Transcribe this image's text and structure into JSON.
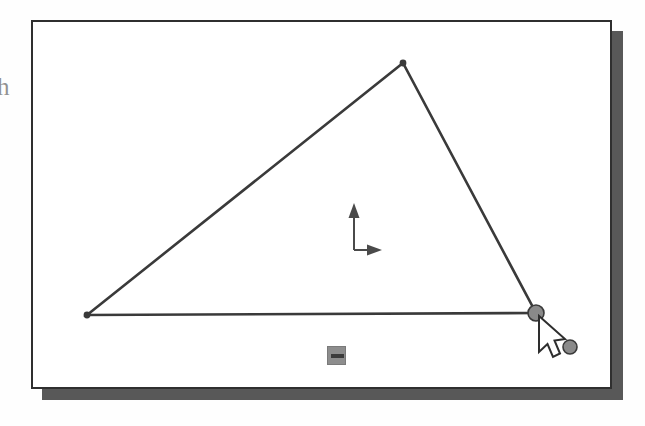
{
  "figure": {
    "kind": "scanned-screenshot",
    "margin_glyph": "h",
    "background_color": "#fefefe"
  },
  "window": {
    "name": "drawing-canvas-window",
    "x": 31,
    "y": 20,
    "width": 581,
    "height": 369,
    "background_color": "#ffffff",
    "border_color": "#2f2f2f",
    "border_width": 2,
    "shadow_color": "#585858",
    "shadow_offset_x": 11,
    "shadow_offset_y": 11
  },
  "canvas": {
    "name": "drawing-area",
    "stroke_color": "#3a3a3a",
    "stroke_width": 2.4
  },
  "shape": {
    "name": "triangle",
    "type": "polygon",
    "closed": true,
    "vertices": [
      {
        "label": "left-vertex",
        "x": 54,
        "y": 293,
        "handle": "dot"
      },
      {
        "label": "apex-vertex",
        "x": 370,
        "y": 41,
        "handle": "dot"
      },
      {
        "label": "right-vertex",
        "x": 503,
        "y": 291,
        "handle": "circle-selected"
      }
    ]
  },
  "handles": {
    "dot_color": "#3a3a3a",
    "dot_radius": 3,
    "circle_fill": "#8a8a8a",
    "circle_stroke": "#3a3a3a",
    "circle_radius": 8,
    "selected_vertex_label": "right-vertex",
    "loose_handle": {
      "label": "loose-control-point",
      "x": 537,
      "y": 325,
      "radius": 7
    }
  },
  "axis_gizmo": {
    "name": "axis-origin-indicator",
    "origin_x": 321,
    "origin_y": 228,
    "y_axis_tip_y": 183,
    "x_axis_tip_x": 347,
    "color": "#4a4a4a",
    "y_axis_label": "",
    "x_axis_label": ""
  },
  "square_marker": {
    "name": "constraint-marker",
    "x": 294,
    "y": 324,
    "size": 19,
    "fill": "#8d8d8d",
    "bar_color": "#3b3b3b"
  },
  "cursor": {
    "name": "mouse-pointer",
    "type": "arrow",
    "tip_x": 506,
    "tip_y": 294,
    "fill": "#ffffff",
    "stroke": "#2e2e2e"
  }
}
